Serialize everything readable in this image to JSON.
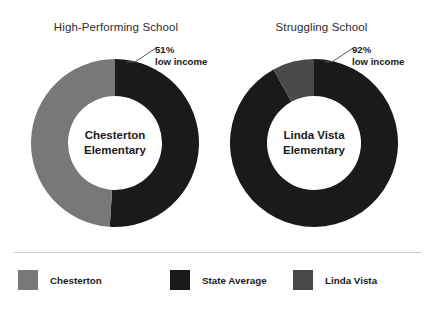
{
  "colors": {
    "background": "#ffffff",
    "chesterton": "#787878",
    "state_average": "#1a1a1a",
    "linda_vista": "#4a4a4a",
    "divider": "#c9c9c9",
    "text": "#1a1a1a",
    "title_text": "#2b2b2b",
    "leader_line": "#555555"
  },
  "panels": [
    {
      "title": "High-Performing School",
      "center_line1": "Chesterton",
      "center_line2": "Elementary",
      "callout_pct": "51%",
      "callout_sub": "low income"
    },
    {
      "title": "Struggling School",
      "center_line1": "Linda Vista",
      "center_line2": "Elementary",
      "callout_pct": "92%",
      "callout_sub": "low income"
    }
  ],
  "legend": {
    "items": [
      {
        "label": "Chesterton",
        "color": "#787878"
      },
      {
        "label": "State Average",
        "color": "#1a1a1a"
      },
      {
        "label": "Linda Vista",
        "color": "#4a4a4a"
      }
    ]
  },
  "chart_data": {
    "type": "pie",
    "title": "",
    "charts": [
      {
        "title": "High-Performing School",
        "center_label": "Chesterton Elementary",
        "annotation": "51% low income",
        "start_angle": 0,
        "direction": "clockwise",
        "slices": [
          {
            "name": "State Average",
            "value": 51,
            "color": "#1a1a1a"
          },
          {
            "name": "Chesterton",
            "value": 49,
            "color": "#787878"
          }
        ]
      },
      {
        "title": "Struggling School",
        "center_label": "Linda Vista Elementary",
        "annotation": "92% low income",
        "start_angle": 0,
        "direction": "clockwise",
        "slices": [
          {
            "name": "State Average",
            "value": 92,
            "color": "#1a1a1a"
          },
          {
            "name": "Linda Vista",
            "value": 8,
            "color": "#4a4a4a"
          }
        ]
      }
    ],
    "units": "percent",
    "legend_position": "bottom",
    "grid": false
  }
}
